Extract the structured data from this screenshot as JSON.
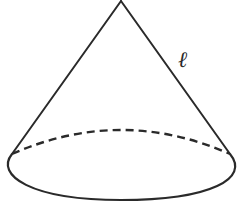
{
  "diagram": {
    "type": "geometry-figure",
    "shape": "right circular cone",
    "labels": {
      "slant_height": "ℓ"
    },
    "geometry": {
      "apex": [
        121,
        1
      ],
      "base_center": [
        121,
        164
      ],
      "base_rx": 113,
      "base_ry": 36,
      "left_tangent": [
        12,
        154
      ],
      "right_tangent": [
        230,
        154
      ]
    },
    "styles": {
      "stroke_color": "#2a2a2a",
      "background": "#ffffff",
      "hidden_edge": "dashed"
    }
  }
}
